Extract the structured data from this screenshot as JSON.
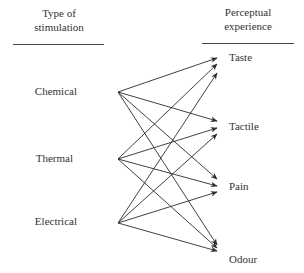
{
  "headers": {
    "left_line1": "Type of",
    "left_line2": "stimulation",
    "right_line1": "Perceptual",
    "right_line2": "experience"
  },
  "sources": [
    {
      "label": "Chemical",
      "x": 118,
      "y": 92
    },
    {
      "label": "Thermal",
      "x": 118,
      "y": 159
    },
    {
      "label": "Electrical",
      "x": 118,
      "y": 223
    }
  ],
  "targets": [
    {
      "label": "Taste"
    },
    {
      "label": "Tactile"
    },
    {
      "label": "Pain"
    },
    {
      "label": "Odour"
    }
  ],
  "edges": [
    {
      "from": "Chemical",
      "to": "Taste"
    },
    {
      "from": "Chemical",
      "to": "Tactile"
    },
    {
      "from": "Chemical",
      "to": "Pain"
    },
    {
      "from": "Chemical",
      "to": "Odour"
    },
    {
      "from": "Thermal",
      "to": "Taste"
    },
    {
      "from": "Thermal",
      "to": "Tactile"
    },
    {
      "from": "Thermal",
      "to": "Pain"
    },
    {
      "from": "Thermal",
      "to": "Odour"
    },
    {
      "from": "Electrical",
      "to": "Taste"
    },
    {
      "from": "Electrical",
      "to": "Tactile"
    },
    {
      "from": "Electrical",
      "to": "Pain"
    },
    {
      "from": "Electrical",
      "to": "Odour"
    }
  ],
  "colors": {
    "line": "#2b2b2b",
    "text": "#333333"
  }
}
